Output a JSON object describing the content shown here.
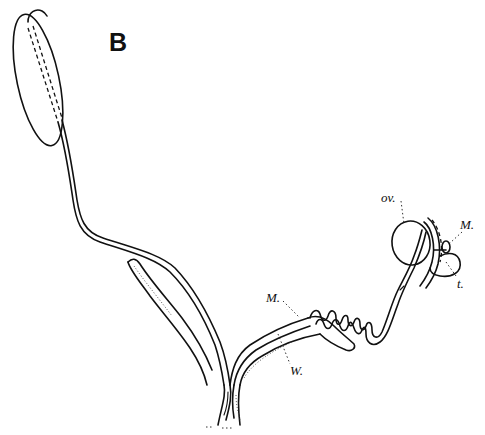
{
  "figure": {
    "panel_label": "B",
    "labels": {
      "ovary": "ov.",
      "mesovarium_upper": "M.",
      "tube": "t.",
      "mesentery_lower": "M.",
      "wolffian_duct": "W."
    }
  }
}
